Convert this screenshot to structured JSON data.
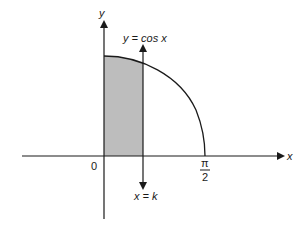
{
  "diagram": {
    "type": "function-area-plot",
    "labels": {
      "x_axis": "x",
      "y_axis": "y",
      "origin": "0",
      "curve": "y = cos x",
      "vertical_line": "x = k",
      "x_tick_numerator": "π",
      "x_tick_denominator": "2"
    },
    "colors": {
      "axes": "#1a1a1a",
      "curve": "#1a1a1a",
      "shaded_region": "#bdbdbd",
      "background": "#ffffff"
    },
    "elements": {
      "curve_function": "cos x",
      "domain": "[0, π/2]",
      "shaded_region": "area under y = cos x from x = 0 to x = k"
    }
  }
}
